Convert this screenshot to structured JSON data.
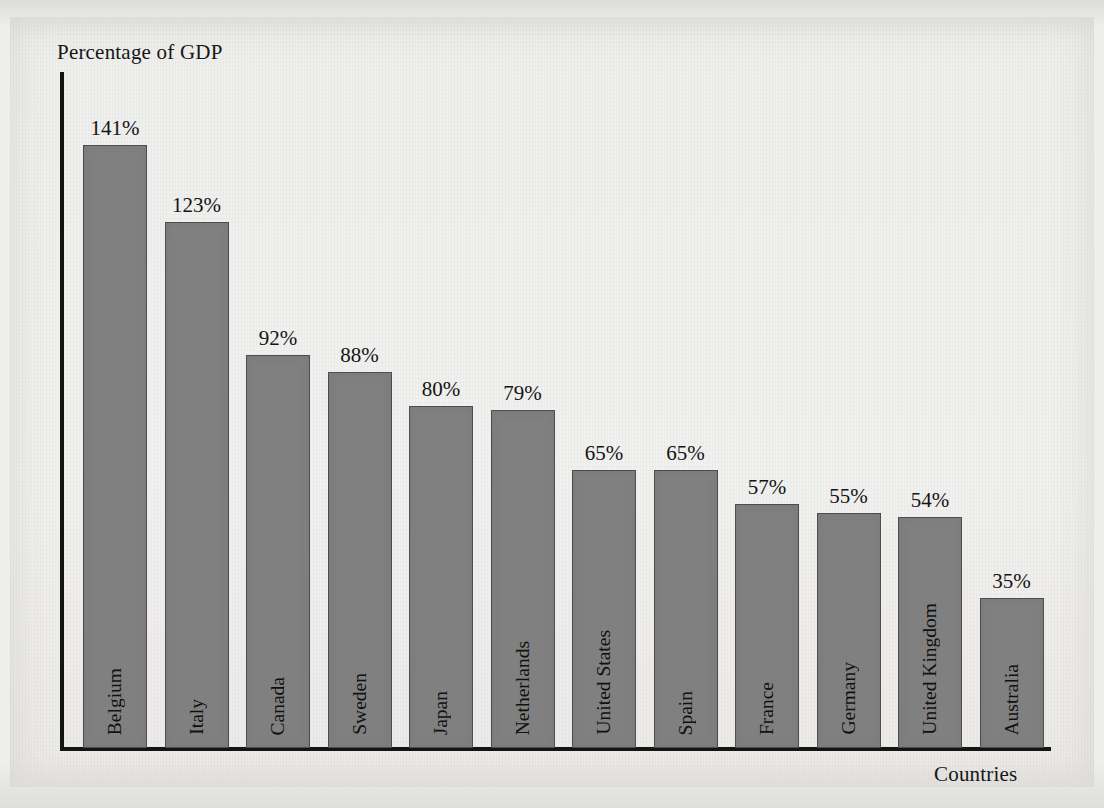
{
  "chart_data": {
    "type": "bar",
    "title": "",
    "xlabel": "Countries",
    "ylabel": "Percentage of GDP",
    "categories": [
      "Belgium",
      "Italy",
      "Canada",
      "Sweden",
      "Japan",
      "Netherlands",
      "United States",
      "Spain",
      "France",
      "Germany",
      "United Kingdom",
      "Australia"
    ],
    "values": [
      141,
      123,
      92,
      88,
      80,
      79,
      65,
      65,
      57,
      55,
      54,
      35
    ],
    "value_labels": [
      "141%",
      "123%",
      "92%",
      "88%",
      "80%",
      "79%",
      "65%",
      "65%",
      "57%",
      "55%",
      "54%",
      "35%"
    ],
    "unit": "%",
    "ylim": [
      0,
      150
    ],
    "grid": false,
    "legend": null,
    "axis_tick_labels": [],
    "orientation": "vertical",
    "category_label_placement": "inside-bar-rotated",
    "value_label_placement": "above-bar"
  },
  "style": {
    "bar_fill": "#808080",
    "bar_stroke": "#4d4d4d",
    "axis_color": "#141414",
    "text_color": "#141414",
    "page_background": "#efefed",
    "canvas_background": "#eeeeec"
  },
  "geometry": {
    "baseline_y": 748,
    "axis_left_x": 60,
    "axis_top_y": 72,
    "axis_right_x": 1051,
    "bar_width": 64,
    "bar_pitch": 81.5,
    "first_bar_x": 83,
    "px_per_percent": 4.276
  }
}
